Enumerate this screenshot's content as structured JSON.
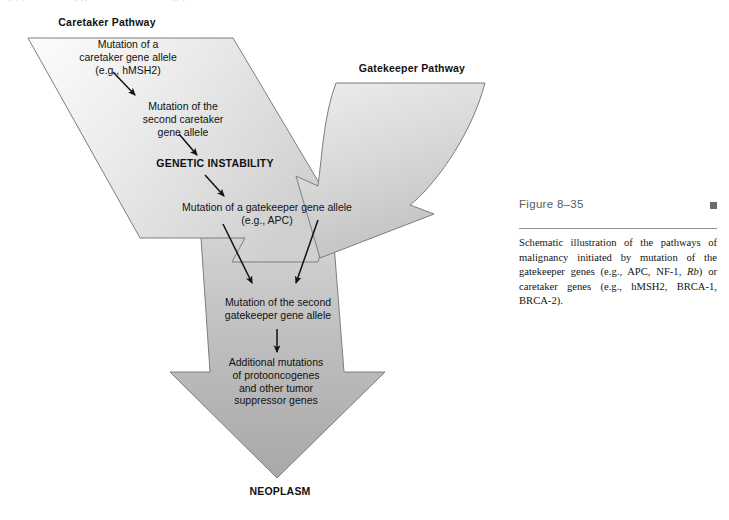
{
  "figure": {
    "title": "Figure 8–35",
    "caption_prefix": "Schematic illustration of the pathways of malignancy initiated by mutation of the gatekeeper genes (e.g., APC, NF-1, ",
    "caption_italic": "Rb",
    "caption_suffix": ") or caretaker genes (e.g., hMSH2, BRCA-1, BRCA-2).",
    "marker": "square-marker"
  },
  "diagram": {
    "type": "flow-diagram",
    "pathways": [
      {
        "id": "caretaker",
        "label": "Caretaker Pathway",
        "origin": "upper-left"
      },
      {
        "id": "gatekeeper",
        "label": "Gatekeeper Pathway",
        "origin": "upper-right"
      }
    ],
    "steps": [
      {
        "id": "step-1",
        "pathway": "caretaker",
        "text": "Mutation of a\ncaretaker gene allele\n(e.g., hMSH2)"
      },
      {
        "id": "step-2",
        "pathway": "caretaker",
        "text": "Mutation of the\nsecond caretaker\ngene allele"
      },
      {
        "id": "step-3",
        "pathway": "caretaker",
        "text": "GENETIC INSTABILITY",
        "emphasis": "bold"
      },
      {
        "id": "step-4",
        "pathway": "both",
        "text": "Mutation of a gatekeeper gene allele\n(e.g., APC)"
      },
      {
        "id": "step-5",
        "pathway": "merged",
        "text": "Mutation of the second\ngatekeeper gene allele"
      },
      {
        "id": "step-6",
        "pathway": "merged",
        "text": "Additional mutations\nof protooncogenes\nand other tumor\nsuppressor genes"
      }
    ],
    "outcome": {
      "id": "outcome",
      "text": "NEOPLASM",
      "emphasis": "bold"
    },
    "connector_count": 6
  },
  "colors": {
    "arrow_fill_light": "#f2f2f2",
    "arrow_fill_mid": "#d6d6d6",
    "arrow_fill_dark": "#ababab",
    "arrow_stroke": "#7d7d7d",
    "text": "#111111",
    "caption_title": "#5a5a5a",
    "rule": "#8f8f8f",
    "marker": "#6b6b6b"
  },
  "scan_artifacts": [
    {
      "text": "·  · ·",
      "left": 8
    },
    {
      "text": "· ··",
      "left": 74
    },
    {
      "text": "·· ·",
      "left": 172
    }
  ]
}
